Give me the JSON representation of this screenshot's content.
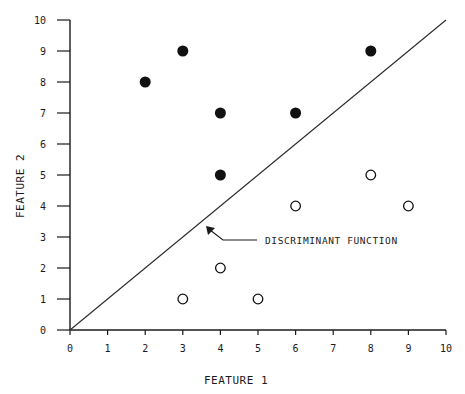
{
  "chart_data": {
    "type": "scatter",
    "title": "",
    "xlabel": "FEATURE 1",
    "ylabel": "FEATURE 2",
    "xlim": [
      0,
      10
    ],
    "ylim": [
      0,
      10
    ],
    "xticks": [
      0,
      1,
      2,
      3,
      4,
      5,
      6,
      7,
      8,
      9,
      10
    ],
    "yticks": [
      0,
      1,
      2,
      3,
      4,
      5,
      6,
      7,
      8,
      9,
      10
    ],
    "grid": false,
    "legend": null,
    "series": [
      {
        "name": "Class A (filled)",
        "marker": "filled-circle",
        "color": "#111111",
        "points": [
          {
            "x": 2,
            "y": 8
          },
          {
            "x": 3,
            "y": 9
          },
          {
            "x": 4,
            "y": 7
          },
          {
            "x": 4,
            "y": 5
          },
          {
            "x": 6,
            "y": 7
          },
          {
            "x": 8,
            "y": 9
          }
        ]
      },
      {
        "name": "Class B (open)",
        "marker": "open-circle",
        "color": "#111111",
        "points": [
          {
            "x": 3,
            "y": 1
          },
          {
            "x": 4,
            "y": 2
          },
          {
            "x": 5,
            "y": 1
          },
          {
            "x": 6,
            "y": 4
          },
          {
            "x": 8,
            "y": 5
          },
          {
            "x": 9,
            "y": 4
          }
        ]
      }
    ],
    "lines": [
      {
        "name": "Discriminant function",
        "from": {
          "x": 0,
          "y": 0
        },
        "to": {
          "x": 10,
          "y": 10
        },
        "equation": "y = x"
      }
    ],
    "annotations": [
      {
        "text": "DISCRIMINANT FUNCTION",
        "arrow_to": {
          "x": 3.6,
          "y": 3.3
        }
      }
    ]
  },
  "labels": {
    "x_axis_title": "FEATURE 1",
    "y_axis_title": "FEATURE 2",
    "annotation": "DISCRIMINANT FUNCTION"
  }
}
